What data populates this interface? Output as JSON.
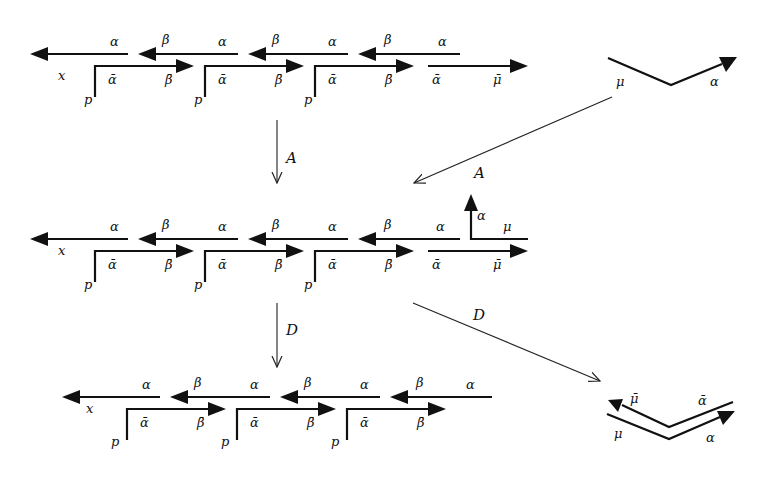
{
  "diagram": {
    "type": "string-diagram",
    "rows": [
      {
        "id": "row1",
        "upper_labels": [
          "α",
          "β",
          "α",
          "β",
          "α",
          "β",
          "α"
        ],
        "lower_labels": [
          "ᾱ",
          "β̄",
          "ᾱ",
          "β̄",
          "ᾱ",
          "β̄",
          "ᾱ",
          "μ̄"
        ],
        "left_label": "x",
        "corner_label": "p"
      },
      {
        "id": "row2",
        "upper_labels": [
          "α",
          "β",
          "α",
          "β",
          "α",
          "β",
          "α"
        ],
        "lower_labels": [
          "ᾱ",
          "β̄",
          "ᾱ",
          "β̄",
          "ᾱ",
          "β̄",
          "ᾱ",
          "μ̄"
        ],
        "left_label": "x",
        "corner_label": "p",
        "extra_up_label": "α",
        "extra_mu_label": "μ"
      },
      {
        "id": "row3",
        "upper_labels": [
          "α",
          "β",
          "α",
          "β",
          "α",
          "β",
          "α"
        ],
        "lower_labels": [
          "ᾱ",
          "β̄",
          "ᾱ",
          "β̄",
          "ᾱ",
          "β̄"
        ],
        "left_label": "x",
        "corner_label": "p"
      }
    ],
    "side_figures": {
      "top": {
        "left_label": "μ",
        "right_label": "α"
      },
      "bottom": {
        "upper_left": "μ̄",
        "upper_right": "ᾱ",
        "lower_left": "μ",
        "lower_right": "α"
      }
    },
    "maps": {
      "vertical_1": "A",
      "diagonal_1": "A",
      "vertical_2": "D",
      "diagonal_2": "D"
    }
  },
  "labels": {
    "x": "x",
    "p": "p",
    "alpha": "α",
    "beta": "β",
    "alpha_bar": "ᾱ",
    "beta_bar": "β̄",
    "mu": "μ",
    "mu_bar": "μ̄",
    "A": "A",
    "D": "D"
  }
}
